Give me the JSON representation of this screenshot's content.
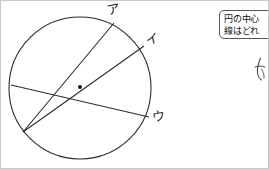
{
  "page": {
    "width": 269,
    "height": 169,
    "background_color": "#ffffff",
    "border_color": "#c9c9c9"
  },
  "diagram": {
    "stroke_color": "#2b2b2b",
    "circle": {
      "cx": 79,
      "cy": 87,
      "r": 71
    },
    "center_dot": {
      "cx": 79,
      "cy": 86,
      "r": 2,
      "label": "center-point"
    },
    "lines": [
      {
        "name": "chord-to-a",
        "from": {
          "x": 22,
          "y": 131
        },
        "to": {
          "x": 113,
          "y": 22
        },
        "endpoint_label": "ア",
        "passes_through_center": false
      },
      {
        "name": "diameter-to-i",
        "from": {
          "x": 22,
          "y": 131
        },
        "to": {
          "x": 143,
          "y": 45
        },
        "endpoint_label": "イ",
        "passes_through_center": true
      },
      {
        "name": "chord-to-u",
        "from": {
          "x": 10,
          "y": 84
        },
        "to": {
          "x": 148,
          "y": 116
        },
        "endpoint_label": "ウ",
        "passes_through_center": false
      }
    ],
    "labels": [
      {
        "name": "label-a",
        "text": "ア"
      },
      {
        "name": "label-i",
        "text": "イ"
      },
      {
        "name": "label-u",
        "text": "ウ"
      }
    ]
  },
  "callout": {
    "name": "question-callout",
    "clipped_at_right_edge": true,
    "lines": [
      "円の中心",
      "線はどれ"
    ]
  },
  "annotation": {
    "name": "handwritten-ink-mark",
    "description": "faint handwritten pen stroke"
  }
}
